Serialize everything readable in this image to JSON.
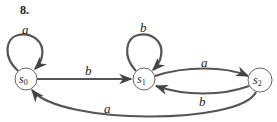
{
  "figure": {
    "number": "8.",
    "type": "finite state machine (state diagram)"
  },
  "colors": {
    "edge": "#555555",
    "node_stroke": "#666666",
    "text": "#222222",
    "background": "#ffffff"
  },
  "nodes": [
    {
      "id": "s0",
      "label": "s",
      "subscript": "0"
    },
    {
      "id": "s1",
      "label": "s",
      "subscript": "1"
    },
    {
      "id": "s2",
      "label": "s",
      "subscript": "2"
    }
  ],
  "edges": [
    {
      "from": "s0",
      "to": "s0",
      "label": "a"
    },
    {
      "from": "s0",
      "to": "s1",
      "label": "b"
    },
    {
      "from": "s1",
      "to": "s1",
      "label": "b"
    },
    {
      "from": "s1",
      "to": "s2",
      "label": "a"
    },
    {
      "from": "s2",
      "to": "s1",
      "label": "b"
    },
    {
      "from": "s2",
      "to": "s0",
      "label": "a"
    }
  ]
}
